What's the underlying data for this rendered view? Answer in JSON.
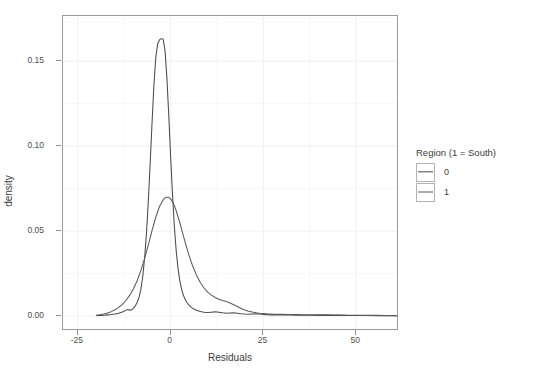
{
  "chart_data": {
    "type": "line",
    "title": "",
    "xlabel": "Residuals",
    "ylabel": "density",
    "xlim": [
      -29,
      61
    ],
    "ylim": [
      -0.0075,
      0.1765
    ],
    "xticks": [
      -25,
      0,
      25,
      50
    ],
    "xtick_labels": [
      "-25",
      "0",
      "25",
      "50"
    ],
    "yticks": [
      0.0,
      0.05,
      0.1,
      0.15
    ],
    "ytick_labels": [
      "0.00",
      "0.05",
      "0.10",
      "0.15"
    ],
    "grid": true,
    "legend_position": "right",
    "legend_title": "Region (1 = South)",
    "series": [
      {
        "name": "0",
        "color": "#4a4a4a",
        "peak_x": -2.0,
        "peak_y": 0.1632,
        "x": [
          -20,
          -19,
          -18,
          -17,
          -16,
          -15,
          -14,
          -13,
          -12,
          -11.5,
          -11,
          -10.5,
          -10,
          -9.5,
          -9,
          -8.5,
          -8,
          -7.5,
          -7,
          -6.5,
          -6,
          -5.5,
          -5,
          -4.5,
          -4,
          -3.5,
          -3,
          -2.5,
          -2,
          -1.5,
          -1,
          -0.5,
          0,
          0.5,
          1,
          1.5,
          2,
          2.5,
          3,
          3.5,
          4,
          4.5,
          5,
          5.5,
          6,
          7,
          8,
          9,
          10,
          11,
          12,
          13,
          14,
          15,
          16,
          17,
          18,
          19,
          20,
          21,
          22,
          23,
          24,
          25,
          26,
          27,
          28,
          30,
          32,
          34,
          36,
          38,
          40,
          42,
          45,
          48,
          50,
          53,
          56,
          59,
          62,
          65
        ],
        "y": [
          0.0004,
          0.0005,
          0.0006,
          0.0008,
          0.001,
          0.0013,
          0.0018,
          0.0025,
          0.0036,
          0.004,
          0.0035,
          0.0038,
          0.0048,
          0.0062,
          0.0082,
          0.0112,
          0.016,
          0.0235,
          0.0345,
          0.049,
          0.068,
          0.0905,
          0.114,
          0.136,
          0.152,
          0.16,
          0.1625,
          0.1632,
          0.1628,
          0.156,
          0.14,
          0.118,
          0.094,
          0.072,
          0.053,
          0.0385,
          0.028,
          0.0205,
          0.0155,
          0.012,
          0.0095,
          0.0078,
          0.0064,
          0.0054,
          0.0046,
          0.0035,
          0.0028,
          0.0024,
          0.0022,
          0.0024,
          0.0026,
          0.0024,
          0.002,
          0.0018,
          0.0019,
          0.002,
          0.0018,
          0.0015,
          0.0013,
          0.0012,
          0.0013,
          0.0014,
          0.0013,
          0.0011,
          0.0009,
          0.0008,
          0.0008,
          0.0007,
          0.0007,
          0.0006,
          0.0006,
          0.0006,
          0.0005,
          0.0005,
          0.0005,
          0.0004,
          0.0004,
          0.0004,
          0.0003,
          0.0003,
          0.0003,
          0.0002
        ]
      },
      {
        "name": "1",
        "color": "#5a5a5a",
        "peak_x": -0.5,
        "peak_y": 0.07,
        "x": [
          -20,
          -19,
          -18,
          -17,
          -16,
          -15,
          -14,
          -13,
          -12,
          -11,
          -10,
          -9,
          -8,
          -7,
          -6,
          -5,
          -4,
          -3,
          -2,
          -1.5,
          -1,
          -0.5,
          0,
          0.5,
          1,
          1.5,
          2,
          2.5,
          3,
          3.5,
          4,
          5,
          6,
          7,
          8,
          9,
          10,
          11,
          12,
          13,
          14,
          15,
          16,
          17,
          18,
          19,
          20,
          21,
          22,
          23,
          24,
          25,
          26,
          27,
          28,
          29,
          30,
          32,
          34,
          36,
          38,
          40,
          42,
          44,
          46,
          48,
          50,
          52,
          55,
          58,
          61,
          65
        ],
        "y": [
          0.0006,
          0.0009,
          0.0013,
          0.0019,
          0.0027,
          0.0038,
          0.0052,
          0.007,
          0.0094,
          0.0124,
          0.0162,
          0.021,
          0.027,
          0.034,
          0.042,
          0.0505,
          0.0582,
          0.0645,
          0.0685,
          0.0696,
          0.07,
          0.0699,
          0.069,
          0.0674,
          0.065,
          0.062,
          0.0585,
          0.0548,
          0.0508,
          0.0468,
          0.0428,
          0.0355,
          0.0292,
          0.024,
          0.0198,
          0.0166,
          0.0142,
          0.0124,
          0.011,
          0.01,
          0.0092,
          0.0086,
          0.0078,
          0.0068,
          0.0057,
          0.0046,
          0.0037,
          0.003,
          0.0025,
          0.0021,
          0.0018,
          0.0016,
          0.0014,
          0.0013,
          0.0012,
          0.0011,
          0.0011,
          0.001,
          0.001,
          0.0009,
          0.0009,
          0.0008,
          0.0008,
          0.0007,
          0.0007,
          0.0006,
          0.0006,
          0.0005,
          0.0005,
          0.0004,
          0.0003,
          0.0003
        ]
      }
    ]
  },
  "legend": {
    "title": "Region (1 = South)",
    "items": [
      {
        "label": "0"
      },
      {
        "label": "1"
      }
    ]
  },
  "axes": {
    "xlabel": "Residuals",
    "ylabel": "density"
  }
}
